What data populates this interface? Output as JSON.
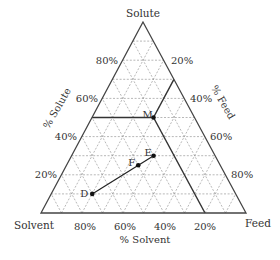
{
  "diagram": {
    "type": "ternary",
    "vertices": {
      "top": "Solute",
      "bottom_left": "Solvent",
      "bottom_right": "Feed"
    },
    "axes": {
      "left": {
        "title": "% Solute",
        "ticks": [
          "20%",
          "40%",
          "60%",
          "80%"
        ]
      },
      "right": {
        "title": "% Feed",
        "ticks": [
          "20%",
          "40%",
          "60%",
          "80%"
        ]
      },
      "bottom": {
        "title": "% Solvent",
        "ticks": [
          "80%",
          "60%",
          "40%",
          "20%"
        ]
      }
    },
    "grid": {
      "divisions": 10,
      "style": "dashed",
      "color": "#9a9a9a"
    },
    "edge_color": "#444444",
    "points": [
      {
        "label": "M",
        "solute": 50,
        "feed": 30,
        "solvent": 20
      },
      {
        "label": "E",
        "solute": 30,
        "feed": 40,
        "solvent": 30
      },
      {
        "label": "F",
        "solute": 25,
        "feed": 35,
        "solvent": 40
      },
      {
        "label": "D",
        "solute": 10,
        "feed": 20,
        "solvent": 70
      }
    ],
    "segments": [
      {
        "from": "D",
        "to": "E",
        "description": "line through F"
      }
    ],
    "reading_lines_for": "M"
  }
}
